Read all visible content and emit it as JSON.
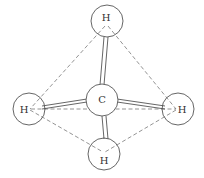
{
  "diagram": {
    "atoms": [
      {
        "id": "C",
        "label": "C",
        "cx": 102,
        "cy": 100,
        "r": 16,
        "lx": 102,
        "ly": 103
      },
      {
        "id": "H1",
        "label": "H",
        "cx": 107,
        "cy": 21,
        "r": 16,
        "lx": 106,
        "ly": 21
      },
      {
        "id": "H2",
        "label": "H",
        "cx": 29,
        "cy": 109,
        "r": 16,
        "lx": 24,
        "ly": 113
      },
      {
        "id": "H3",
        "label": "H",
        "cx": 178,
        "cy": 109,
        "r": 16,
        "lx": 182,
        "ly": 113
      },
      {
        "id": "H4",
        "label": "H",
        "cx": 104,
        "cy": 154,
        "r": 16,
        "lx": 104,
        "ly": 164
      }
    ],
    "bonds": [
      {
        "from": "C",
        "to": "H1",
        "type": "double-line"
      },
      {
        "from": "C",
        "to": "H2",
        "type": "double-line"
      },
      {
        "from": "C",
        "to": "H3",
        "type": "double-line"
      },
      {
        "from": "C",
        "to": "H4",
        "type": "double-line"
      }
    ],
    "tetrahedron_edges": [
      {
        "from": "H1",
        "to": "H2"
      },
      {
        "from": "H1",
        "to": "H3"
      },
      {
        "from": "H2",
        "to": "H3"
      },
      {
        "from": "H2",
        "to": "H4"
      },
      {
        "from": "H3",
        "to": "H4"
      }
    ],
    "colors": {
      "line": "#555555",
      "background": "#ffffff"
    }
  }
}
